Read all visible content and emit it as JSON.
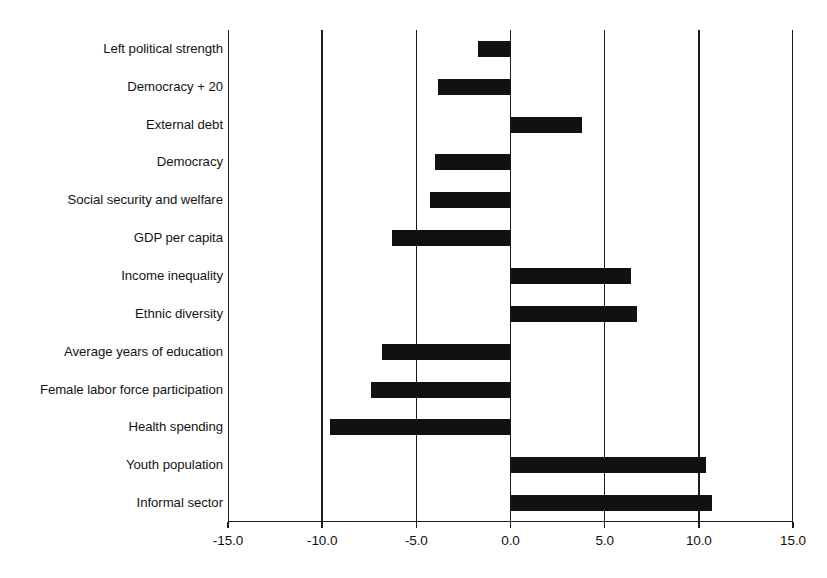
{
  "chart_data": {
    "type": "bar",
    "orientation": "horizontal",
    "title": "",
    "subtitle": "",
    "xlabel": "",
    "ylabel": "",
    "xlim": [
      -15.0,
      15.0
    ],
    "ylim": [],
    "grid": true,
    "legend": null,
    "legend_position": "none",
    "bar_color": "#111111",
    "axis_color": "#1b1b1b",
    "background_color": "#ffffff",
    "xticks": [
      -15.0,
      -10.0,
      -5.0,
      0.0,
      5.0,
      10.0,
      15.0
    ],
    "xtick_labels": [
      "-15.0",
      "-10.0",
      "-5.0",
      "0.0",
      "5.0",
      "10.0",
      "15.0"
    ],
    "categories": [
      "Left political strength",
      "Democracy + 20",
      "External debt",
      "Democracy",
      "Social security and welfare",
      "GDP per capita",
      "Income inequality",
      "Ethnic diversity",
      "Average years of education",
      "Female labor force participation",
      "Health spending",
      "Youth population",
      "Informal sector"
    ],
    "values": [
      -1.75,
      -3.85,
      3.8,
      -4.0,
      -4.3,
      -6.3,
      6.4,
      6.7,
      -6.8,
      -7.4,
      -9.6,
      10.4,
      10.7
    ]
  }
}
